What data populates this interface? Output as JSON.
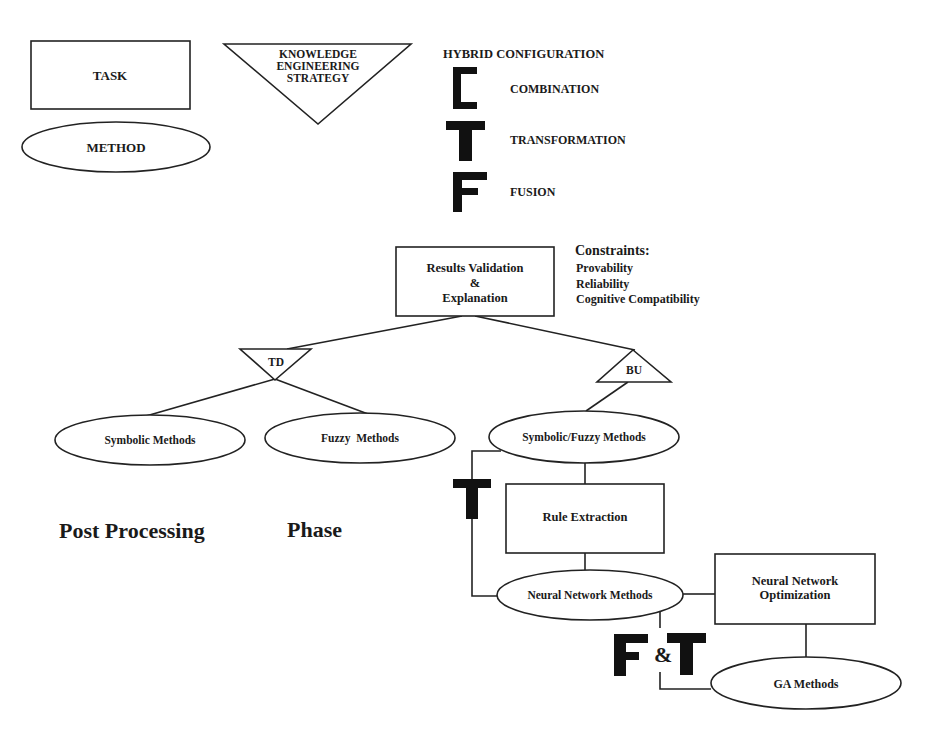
{
  "legend": {
    "task_label": "TASK",
    "method_label": "METHOD",
    "strategy_label_lines": [
      "KNOWLEDGE",
      "ENGINEERING",
      "STRATEGY"
    ],
    "hybrid_title": "HYBRID CONFIGURATION",
    "hybrid_items": [
      {
        "symbol": "C",
        "label": "COMBINATION"
      },
      {
        "symbol": "T",
        "label": "TRANSFORMATION"
      },
      {
        "symbol": "F",
        "label": "FUSION"
      }
    ]
  },
  "root": {
    "label_lines": [
      "Results Validation",
      "&",
      "Explanation"
    ]
  },
  "constraints": {
    "title": "Constraints:",
    "items": [
      "Provability",
      "Reliability",
      "Cognitive Compatibility"
    ]
  },
  "strategies": {
    "td": "TD",
    "bu": "BU"
  },
  "methods": {
    "symbolic": "Symbolic Methods",
    "fuzzy": "Fuzzy  Methods",
    "symbolic_fuzzy": "Symbolic/Fuzzy Methods",
    "neural": "Neural Network Methods",
    "ga": "GA Methods"
  },
  "tasks": {
    "rule_extraction": "Rule Extraction",
    "nn_optimization_lines": [
      "Neural Network",
      "Optimization"
    ]
  },
  "annotations": {
    "transform_symbol": "T",
    "fusion_transform": {
      "f": "F",
      "amp": "&",
      "t": "T"
    }
  },
  "phase": {
    "left": "Post Processing",
    "right": "Phase"
  }
}
